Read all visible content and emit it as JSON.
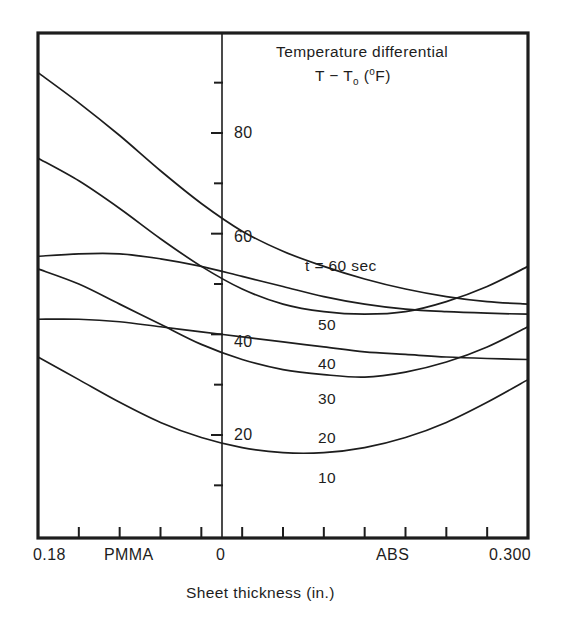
{
  "figure": {
    "background_color": "#ffffff",
    "line_color": "#1d1d1d"
  },
  "title": {
    "line1": "Temperature differential",
    "line2_prefix": "T − T",
    "line2_sub": "o",
    "line2_mid": " (",
    "line2_sup": "o",
    "line2_suffix": "F)"
  },
  "axes": {
    "x_caption": "Sheet thickness (in.)",
    "x_tick_labels": [
      {
        "text": "0.18",
        "x": 38
      },
      {
        "text": "PMMA",
        "x": 130
      },
      {
        "text": "0",
        "x": 222
      },
      {
        "text": "ABS",
        "x": 396
      },
      {
        "text": "0.300",
        "x": 528
      }
    ],
    "y_tick_labels": [
      {
        "text": "20",
        "value": 20
      },
      {
        "text": "40",
        "value": 40
      },
      {
        "text": "60",
        "value": 60
      },
      {
        "text": "80",
        "value": 80
      }
    ],
    "y_minor_values": [
      10,
      30,
      50,
      70,
      90
    ]
  },
  "chart_data": {
    "type": "line",
    "xlabel": "Sheet thickness (in.)",
    "ylabel": "Temperature differential T − To (°F)",
    "xlim": [
      0,
      12
    ],
    "ylim": [
      0,
      100
    ],
    "grid": false,
    "legend": "inline curve labels",
    "x_axis_note": "Left half labelled PMMA (0.18 in. at far left), right half labelled ABS (0.300 in. at far right); vertical reference axis at the '0' position in the middle",
    "x_tick_labels": [
      "0.18",
      "PMMA",
      "0",
      "ABS",
      "0.300"
    ],
    "y_ticks_major": [
      20,
      40,
      60,
      80
    ],
    "y_ticks_minor": [
      10,
      30,
      50,
      70,
      90
    ],
    "x": [
      0,
      1,
      2,
      3,
      4,
      5,
      6,
      7,
      8,
      9,
      10,
      11,
      12
    ],
    "series": [
      {
        "name": "t = 60 sec",
        "label": "t = 60 sec",
        "label_x": 305,
        "label_y": 258,
        "values": [
          92.0,
          86.0,
          79.5,
          72.5,
          66.0,
          60.5,
          56.5,
          53.5,
          51.0,
          49.0,
          47.5,
          46.5,
          46.0
        ]
      },
      {
        "name": "50 sec",
        "label": "50",
        "label_x": 318,
        "label_y": 317,
        "values": [
          75.0,
          70.5,
          65.0,
          59.0,
          53.5,
          49.0,
          46.0,
          44.5,
          44.0,
          44.5,
          46.5,
          49.5,
          53.5
        ]
      },
      {
        "name": "40 sec",
        "label": "40",
        "label_x": 318,
        "label_y": 356,
        "values": [
          55.5,
          56.0,
          56.0,
          55.0,
          53.5,
          51.5,
          49.5,
          47.5,
          46.0,
          45.0,
          44.5,
          44.2,
          44.0
        ]
      },
      {
        "name": "30 sec",
        "label": "30",
        "label_x": 318,
        "label_y": 391,
        "values": [
          53.0,
          50.0,
          46.0,
          42.0,
          38.0,
          35.0,
          33.0,
          32.0,
          31.5,
          32.5,
          34.5,
          37.5,
          41.5
        ]
      },
      {
        "name": "20 sec",
        "label": "20",
        "label_x": 318,
        "label_y": 430,
        "values": [
          43.0,
          43.0,
          42.5,
          41.5,
          40.5,
          39.5,
          38.5,
          37.5,
          36.5,
          36.0,
          35.5,
          35.2,
          35.0
        ]
      },
      {
        "name": "10 sec",
        "label": "10",
        "label_x": 318,
        "label_y": 470,
        "values": [
          35.5,
          31.0,
          26.5,
          22.5,
          19.5,
          17.5,
          16.5,
          16.5,
          17.5,
          19.5,
          22.5,
          26.5,
          31.0
        ]
      }
    ]
  }
}
